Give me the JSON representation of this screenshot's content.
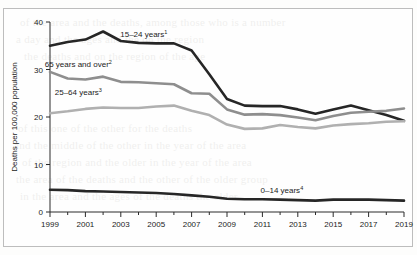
{
  "chart_data": {
    "type": "line",
    "title": "",
    "xlabel": "",
    "ylabel": "Deaths per 100,000 population",
    "x": [
      1999,
      2000,
      2001,
      2002,
      2003,
      2004,
      2005,
      2006,
      2007,
      2008,
      2009,
      2010,
      2011,
      2012,
      2013,
      2014,
      2015,
      2016,
      2017,
      2018,
      2019
    ],
    "xlim": [
      1999,
      2019
    ],
    "ylim": [
      0,
      40
    ],
    "yticks": [
      0,
      10,
      20,
      30,
      40
    ],
    "xticks_major": [
      "1999",
      "2001",
      "2003",
      "2005",
      "2007",
      "2009",
      "2011",
      "2013",
      "2015",
      "2017",
      "2019"
    ],
    "xticks_minor": [
      "2000",
      "2002",
      "2004",
      "2006",
      "2008",
      "2010",
      "2012",
      "2014",
      "2016",
      "2018"
    ],
    "grid": false,
    "legend_position": "inline-annotations",
    "series": [
      {
        "name": "15-24 years",
        "label": "15–24 years",
        "footnote": "1",
        "color": "#262626",
        "width": 2.6,
        "label_x": 2004.3,
        "label_y": 36.9,
        "values": [
          35.0,
          35.8,
          36.3,
          38.0,
          36.0,
          35.6,
          35.5,
          35.5,
          34.0,
          29.0,
          23.8,
          22.4,
          22.3,
          22.3,
          21.6,
          20.7,
          21.6,
          22.4,
          21.4,
          20.4,
          19.2
        ]
      },
      {
        "name": "65 years and over",
        "label": "65 years and over",
        "footnote": "2",
        "color": "#8e8e8e",
        "width": 2.6,
        "label_x": 2000.6,
        "label_y": 30.6,
        "values": [
          29.5,
          28.1,
          27.9,
          28.5,
          27.4,
          27.3,
          27.1,
          26.9,
          25.0,
          24.9,
          21.6,
          20.5,
          20.6,
          20.4,
          19.9,
          19.3,
          20.2,
          20.9,
          21.1,
          21.3,
          21.8
        ]
      },
      {
        "name": "25-64 years",
        "label": "25–64 years",
        "footnote": "3",
        "color": "#b0b0b0",
        "width": 2.6,
        "label_x": 2000.6,
        "label_y": 24.6,
        "values": [
          20.8,
          21.2,
          21.7,
          22.0,
          21.9,
          21.9,
          22.2,
          22.4,
          21.3,
          20.4,
          18.4,
          17.5,
          17.6,
          18.3,
          17.9,
          17.6,
          18.2,
          18.5,
          18.7,
          19.0,
          19.1
        ]
      },
      {
        "name": "0-14 years",
        "label": "0–14 years",
        "footnote": "4",
        "color": "#262626",
        "width": 2.6,
        "label_x": 2012.1,
        "label_y": 4.1,
        "values": [
          4.7,
          4.6,
          4.4,
          4.3,
          4.2,
          4.1,
          4.0,
          3.8,
          3.5,
          3.2,
          2.8,
          2.7,
          2.7,
          2.6,
          2.5,
          2.4,
          2.6,
          2.6,
          2.6,
          2.5,
          2.4
        ]
      }
    ]
  },
  "page_artifacts": {
    "bleed_lines": [
      "of the area and the deaths, among those who is a number",
      "a day and the ages and the on the region",
      "the deaths and on the region of the age",
      "of this one of the other for the deaths",
      "and the middle of the other in the year of the area",
      "of the region and the older in the year of the area",
      "the area of the deaths and the other of the older group",
      "in the area and the ages of the deaths the older"
    ]
  }
}
